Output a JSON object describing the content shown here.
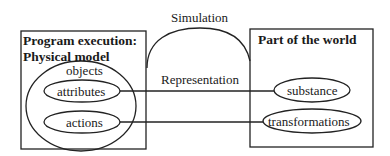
{
  "diagram": {
    "arch_label": "Simulation",
    "line_label": "Representation",
    "left_box": {
      "title_line1": "Program execution:",
      "title_line2": "Physical model",
      "outer_ellipse_label": "objects",
      "inner_ellipses": [
        "attributes",
        "actions"
      ]
    },
    "right_box": {
      "title": "Part of the world",
      "ellipses": [
        "substance",
        "transformations"
      ]
    },
    "connections": [
      {
        "from": "attributes",
        "to": "substance"
      },
      {
        "from": "actions",
        "to": "transformations"
      }
    ]
  }
}
